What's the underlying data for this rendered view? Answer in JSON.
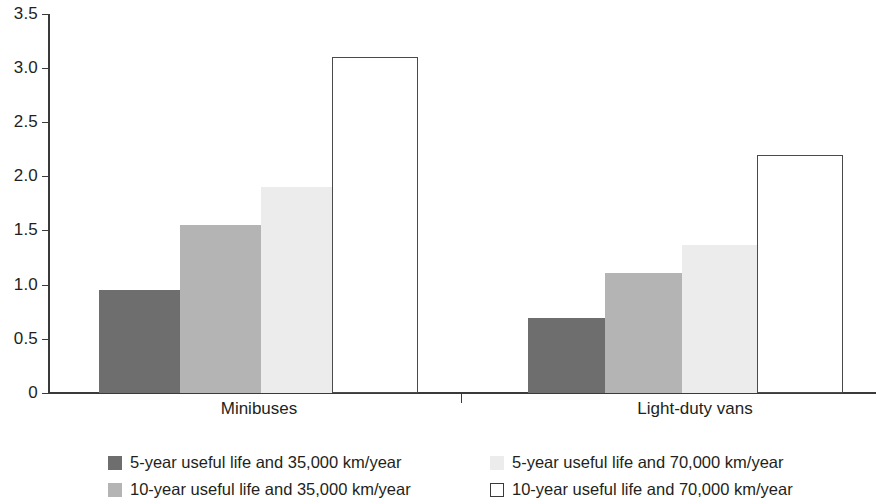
{
  "chart_data": {
    "type": "bar",
    "title": "",
    "xlabel": "",
    "ylabel": "",
    "categories": [
      "Minibuses",
      "Light-duty vans"
    ],
    "series": [
      {
        "name": "5-year useful life and 35,000 km/year",
        "values": [
          0.95,
          0.69
        ],
        "color": "#6e6e6e"
      },
      {
        "name": "10-year useful life and 35,000 km/year",
        "values": [
          1.55,
          1.11
        ],
        "color": "#b4b4b4"
      },
      {
        "name": "5-year useful life and 70,000 km/year",
        "values": [
          1.9,
          1.37
        ],
        "color": "#ececec"
      },
      {
        "name": "10-year useful life and 70,000 km/year",
        "values": [
          3.1,
          2.2
        ],
        "color": "#ffffff"
      }
    ],
    "ylim": [
      0,
      3.5
    ],
    "yticks": [
      "0",
      "0.5",
      "1.0",
      "1.5",
      "2.0",
      "2.5",
      "3.0",
      "3.5"
    ],
    "ytick_values": [
      0,
      0.5,
      1.0,
      1.5,
      2.0,
      2.5,
      3.0,
      3.5
    ],
    "grid": false,
    "legend_position": "bottom",
    "legend_columns": 2
  },
  "axis": {
    "tick_0": "0",
    "tick_1": "0.5",
    "tick_2": "1.0",
    "tick_3": "1.5",
    "tick_4": "2.0",
    "tick_5": "2.5",
    "tick_6": "3.0",
    "tick_7": "3.5"
  },
  "groups": {
    "g0_label": "Minibuses",
    "g1_label": "Light-duty vans"
  },
  "legend": {
    "item_0": "5-year useful life and 35,000 km/year",
    "item_1": "5-year useful life and 70,000 km/year",
    "item_2": "10-year useful life and 35,000 km/year",
    "item_3": "10-year useful life and 70,000 km/year"
  }
}
